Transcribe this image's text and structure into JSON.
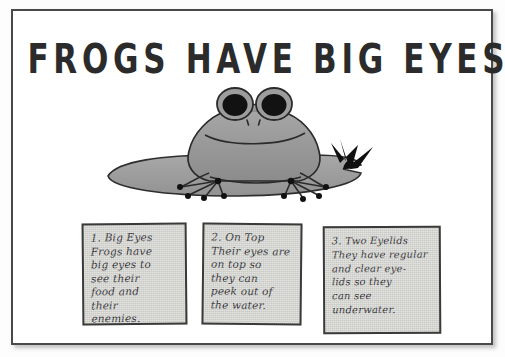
{
  "poster": {
    "title": "FROGS HAVE BIG EYES",
    "colors": {
      "page_background": "#ffffff",
      "frame_border": "#4a4a4a",
      "ink": "#2b2b2b",
      "frog_body": "#9a9a9a",
      "lily_pad": "#9e9e9e",
      "flower": "#101010",
      "note_paper": "#d8d8d4"
    }
  },
  "illustration": {
    "subject": "frog-on-lily-pad",
    "parts": {
      "frog": "frog-figure",
      "left_eye": "frog-left-eye",
      "right_eye": "frog-right-eye",
      "nostrils": "frog-nostrils",
      "mouth": "frog-mouth",
      "front_left_foot": "frog-front-left-foot",
      "front_right_foot": "frog-front-right-foot",
      "lily_pad": "lily-pad",
      "flower": "water-plant"
    }
  },
  "facts": [
    {
      "number": "1.",
      "heading": "Big Eyes",
      "body": "1. Big Eyes\nFrogs have\nbig eyes to\nsee their\nfood and\ntheir\nenemies."
    },
    {
      "number": "2.",
      "heading": "On Top",
      "body": "2. On Top\nTheir eyes are\non top so\nthey can\npeek out of\nthe water."
    },
    {
      "number": "3.",
      "heading": "Two Eyelids",
      "body": "3. Two Eyelids\nThey have regular\nand clear eye-\nlids so they\ncan see\nunderwater."
    }
  ]
}
